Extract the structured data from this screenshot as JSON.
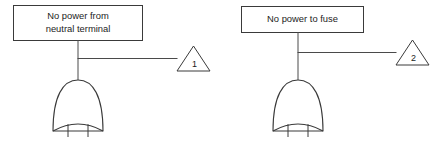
{
  "diagram": {
    "type": "fault-tree",
    "title": "",
    "colors": {
      "background": "#ffffff",
      "stroke": "#3a3a3a",
      "connector": "#4a4a4a",
      "text": "#1c1c1c"
    },
    "branches": [
      {
        "id": "branch-1",
        "event": {
          "lines": [
            "No power from",
            "neutral terminal"
          ],
          "line1": "No power from",
          "line2": "neutral terminal"
        },
        "gate": {
          "kind": "or-gate",
          "input_count": 2
        },
        "transfer": {
          "symbol": "transfer-triangle",
          "label": "1"
        }
      },
      {
        "id": "branch-2",
        "event": {
          "lines": [
            "No power to fuse"
          ],
          "line1": "No power to fuse",
          "line2": ""
        },
        "gate": {
          "kind": "or-gate",
          "input_count": 2
        },
        "transfer": {
          "symbol": "transfer-triangle",
          "label": "2"
        }
      }
    ]
  }
}
